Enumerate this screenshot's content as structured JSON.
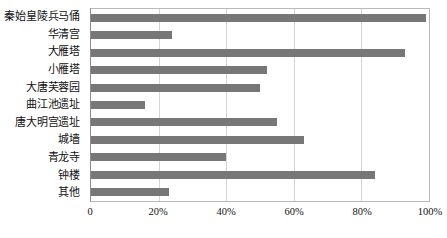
{
  "chart_data": {
    "type": "bar",
    "orientation": "horizontal",
    "title": "",
    "xlabel": "",
    "ylabel": "",
    "xlim": [
      0,
      100
    ],
    "grid": true,
    "legend": false,
    "tick_labels": [
      "0",
      "20%",
      "40%",
      "60%",
      "80%",
      "100%"
    ],
    "tick_values": [
      0,
      20,
      40,
      60,
      80,
      100
    ],
    "bar_color": "#777777",
    "categories": [
      "秦始皇陵兵马俑",
      "华清宫",
      "大雁塔",
      "小雁塔",
      "大唐芙蓉园",
      "曲江池遗址",
      "唐大明宫遗址",
      "城墙",
      "青龙寺",
      "钟楼",
      "其他"
    ],
    "values": [
      99,
      24,
      93,
      52,
      50,
      16,
      55,
      63,
      40,
      84,
      23
    ]
  }
}
